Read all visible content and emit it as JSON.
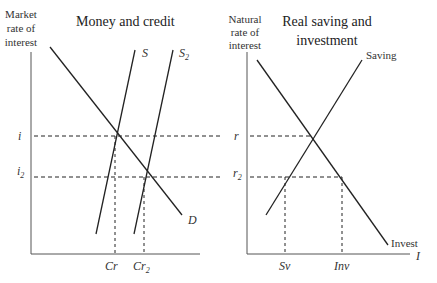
{
  "left_panel": {
    "title": "Money and credit",
    "y_axis_label": [
      "Market",
      "rate of",
      "interest"
    ],
    "curves": {
      "demand": "D",
      "supply": "S",
      "supply2": "S",
      "supply2_sub": "2"
    },
    "y_ticks": {
      "i": "i",
      "i2": "i",
      "i2_sub": "2"
    },
    "x_ticks": {
      "cr": "Cr",
      "cr2": "Cr",
      "cr2_sub": "2"
    }
  },
  "right_panel": {
    "title_line1": "Real saving and",
    "title_line2": "investment",
    "y_axis_label": [
      "Natural",
      "rate of",
      "interest"
    ],
    "x_axis_label": "I",
    "curves": {
      "saving": "Saving",
      "invest": "Invest"
    },
    "y_ticks": {
      "r": "r",
      "r2": "r",
      "r2_sub": "2"
    },
    "x_ticks": {
      "sv": "Sv",
      "inv": "Inv"
    }
  }
}
